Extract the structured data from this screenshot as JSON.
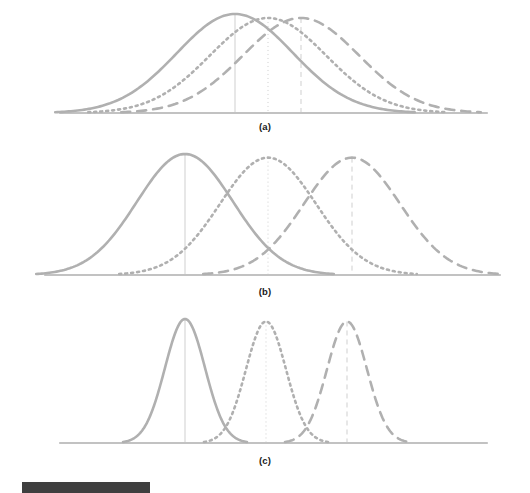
{
  "figure": {
    "title": "",
    "panels": [
      {
        "id": "a",
        "label": "(a)"
      },
      {
        "id": "b",
        "label": "(b)"
      },
      {
        "id": "c",
        "label": "(c)"
      }
    ],
    "caption_bar": {
      "visible": true,
      "color": "#3f3f3f"
    }
  },
  "style": {
    "curve_color": "#b0b0b0",
    "baseline_color": "#c2c2c2",
    "guide_color": "#cfcfcf",
    "label_color": "#1a1a1a",
    "background": "#ffffff"
  },
  "chart_data": {
    "type": "line",
    "title": "",
    "xlabel": "",
    "ylabel": "",
    "grid": false,
    "legend": "none",
    "panels": [
      {
        "id": "a",
        "label": "(a)",
        "xlim": [
          60,
          487
        ],
        "ylim": [
          0,
          1
        ],
        "baseline_y": 113,
        "series": [
          {
            "name": "distribution-1",
            "linestyle": "solid",
            "mean": 235,
            "sigma": 58,
            "peak_height": 1.0,
            "guide_line": true
          },
          {
            "name": "distribution-2",
            "linestyle": "dotted",
            "mean": 268,
            "sigma": 58,
            "peak_height": 0.96,
            "guide_line": true
          },
          {
            "name": "distribution-3",
            "linestyle": "dashed",
            "mean": 301,
            "sigma": 58,
            "peak_height": 0.96,
            "guide_line": true
          }
        ]
      },
      {
        "id": "b",
        "label": "(b)",
        "xlim": [
          45,
          500
        ],
        "ylim": [
          0,
          1
        ],
        "baseline_y": 135,
        "series": [
          {
            "name": "distribution-1",
            "linestyle": "solid",
            "mean": 185,
            "sigma": 48,
            "peak_height": 1.0,
            "guide_line": true
          },
          {
            "name": "distribution-2",
            "linestyle": "dotted",
            "mean": 268,
            "sigma": 48,
            "peak_height": 0.97,
            "guide_line": true
          },
          {
            "name": "distribution-3",
            "linestyle": "dashed",
            "mean": 352,
            "sigma": 48,
            "peak_height": 0.97,
            "guide_line": true
          }
        ]
      },
      {
        "id": "c",
        "label": "(c)",
        "xlim": [
          60,
          487
        ],
        "ylim": [
          0,
          1
        ],
        "baseline_y": 138,
        "series": [
          {
            "name": "distribution-1",
            "linestyle": "solid",
            "mean": 185,
            "sigma": 20,
            "peak_height": 1.0,
            "guide_line": true
          },
          {
            "name": "distribution-2",
            "linestyle": "dotted",
            "mean": 266,
            "sigma": 20,
            "peak_height": 0.98,
            "guide_line": true
          },
          {
            "name": "distribution-3",
            "linestyle": "dashed",
            "mean": 347,
            "sigma": 20,
            "peak_height": 0.98,
            "guide_line": true
          }
        ]
      }
    ]
  }
}
